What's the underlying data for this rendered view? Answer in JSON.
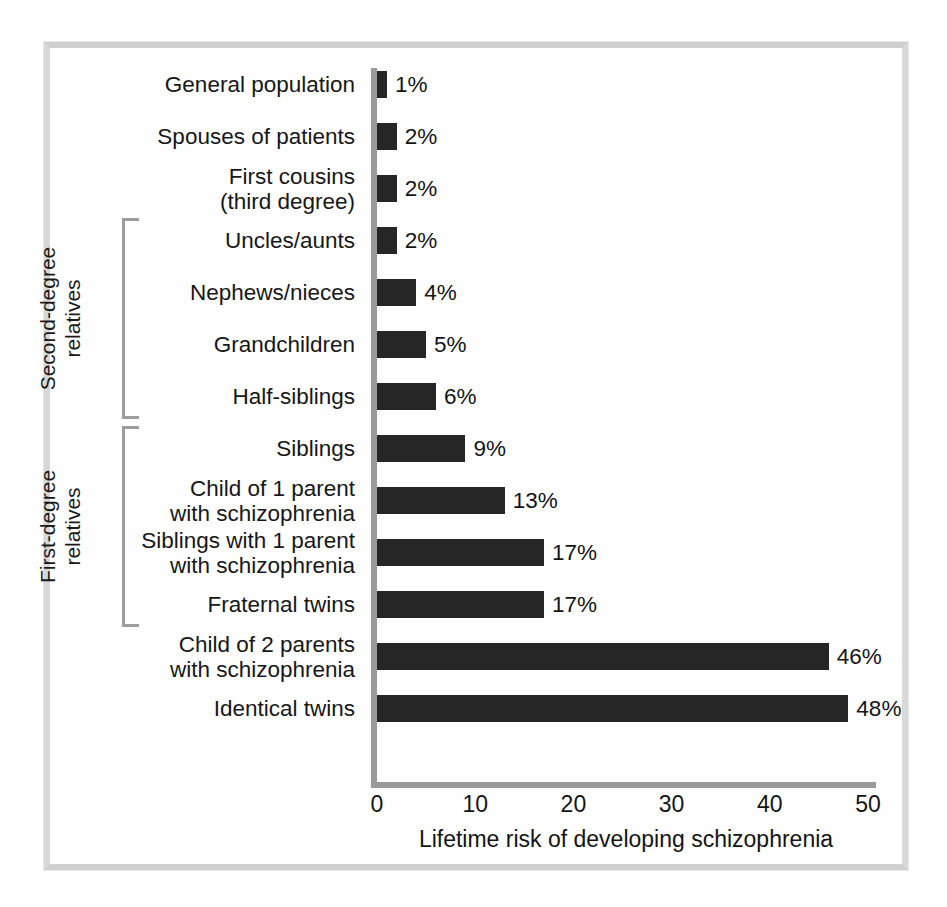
{
  "chart_data": {
    "type": "bar",
    "orientation": "horizontal",
    "title": "",
    "xlabel": "Lifetime risk of developing schizophrenia",
    "ylabel": "",
    "xlim": [
      0,
      50
    ],
    "xticks": [
      "0",
      "10",
      "20",
      "30",
      "40",
      "50"
    ],
    "grid": false,
    "legend": null,
    "bar_color": "#262626",
    "axis_color": "#9a9a9a",
    "categories": [
      "General population",
      "Spouses of patients",
      "First cousins\n(third degree)",
      "Uncles/aunts",
      "Nephews/nieces",
      "Grandchildren",
      "Half-siblings",
      "Siblings",
      "Child of 1 parent\nwith schizophrenia",
      "Siblings with 1 parent\nwith schizophrenia",
      "Fraternal twins",
      "Child of 2 parents\nwith schizophrenia",
      "Identical twins"
    ],
    "values": [
      1,
      2,
      2,
      2,
      4,
      5,
      6,
      9,
      13,
      17,
      17,
      46,
      48
    ],
    "value_labels": [
      "1%",
      "2%",
      "2%",
      "2%",
      "4%",
      "5%",
      "6%",
      "9%",
      "13%",
      "17%",
      "17%",
      "46%",
      "48%"
    ],
    "groups": [
      {
        "label": "Second-degree\nrelatives",
        "first_index": 3,
        "last_index": 6
      },
      {
        "label": "First-degree\nrelatives",
        "first_index": 7,
        "last_index": 10
      }
    ]
  }
}
